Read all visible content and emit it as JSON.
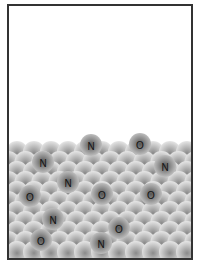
{
  "diagram": {
    "title": "",
    "frame": {
      "border_color": "#333333",
      "background": "#ffffff"
    },
    "lattice": {
      "description": "close-packed surface of gray spheres",
      "sphere_color_center": "#8a8a8a",
      "sphere_color_edge": "#e6e6e6",
      "radius": 11,
      "dx": 17,
      "dy": 10,
      "top_y": 150,
      "rows": 11,
      "x_start": -2
    },
    "adsorbed_atoms": [
      {
        "label": "N",
        "x": 89,
        "y": 143
      },
      {
        "label": "O",
        "x": 138,
        "y": 142
      },
      {
        "label": "N",
        "x": 41,
        "y": 160
      },
      {
        "label": "N",
        "x": 163,
        "y": 164
      },
      {
        "label": "N",
        "x": 66,
        "y": 180
      },
      {
        "label": "O",
        "x": 28,
        "y": 194
      },
      {
        "label": "O",
        "x": 100,
        "y": 192
      },
      {
        "label": "O",
        "x": 149,
        "y": 192
      },
      {
        "label": "N",
        "x": 51,
        "y": 217
      },
      {
        "label": "O",
        "x": 117,
        "y": 226
      },
      {
        "label": "O",
        "x": 39,
        "y": 238
      },
      {
        "label": "N",
        "x": 99,
        "y": 241
      }
    ],
    "atom_style": {
      "center": "#555555",
      "edge": "#c8c8c8"
    }
  }
}
